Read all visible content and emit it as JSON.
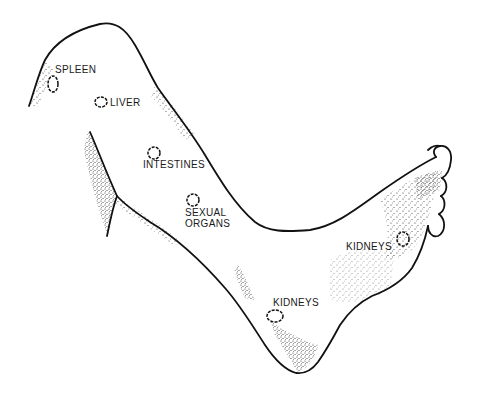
{
  "diagram": {
    "ink_color": "#111111",
    "background": "#ffffff",
    "labels": [
      {
        "id": "spleen",
        "text": "SPLEEN",
        "x": 53,
        "y": 66
      },
      {
        "id": "liver",
        "text": "LIVER",
        "x": 111,
        "y": 97
      },
      {
        "id": "intestines",
        "text": "INTESTINES",
        "x": 142,
        "y": 160
      },
      {
        "id": "sexual-organs",
        "text": "SEXUAL\nORGANS",
        "x": 185,
        "y": 209
      },
      {
        "id": "kidneys-foot",
        "text": "KIDNEYS",
        "x": 347,
        "y": 243
      },
      {
        "id": "kidneys-ankle",
        "text": "KIDNEYS",
        "x": 273,
        "y": 297
      }
    ],
    "points": [
      {
        "id": "spleen-point",
        "cx": 53,
        "cy": 84,
        "rx": 5,
        "ry": 8
      },
      {
        "id": "liver-point",
        "cx": 101,
        "cy": 102,
        "rx": 6,
        "ry": 5
      },
      {
        "id": "intestines-point",
        "cx": 154,
        "cy": 153,
        "rx": 6,
        "ry": 6
      },
      {
        "id": "sexual-organs-point",
        "cx": 193,
        "cy": 200,
        "rx": 6,
        "ry": 6
      },
      {
        "id": "kidneys-foot-point",
        "cx": 403,
        "cy": 239,
        "rx": 6,
        "ry": 7
      },
      {
        "id": "kidneys-ankle-point",
        "cx": 275,
        "cy": 316,
        "rx": 8,
        "ry": 6
      }
    ]
  }
}
